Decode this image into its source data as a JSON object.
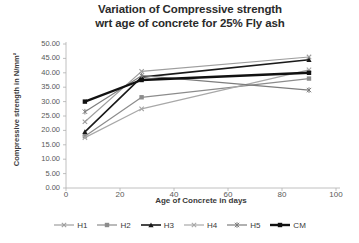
{
  "chart_data": {
    "type": "line",
    "title": "Variation of Compressive strength wrt age of concrete for 25% Fly ash",
    "title_line1": "Variation of Compressive strength",
    "title_line2": "wrt age of concrete for 25% Fly ash",
    "xlabel": "Age of Concrete in days",
    "ylabel": "Compressive strength in N/mm²",
    "x": [
      7,
      28,
      90
    ],
    "xlim": [
      0,
      100
    ],
    "ylim": [
      0,
      50
    ],
    "xticks": [
      "0",
      "20",
      "40",
      "60",
      "80",
      "100"
    ],
    "xtick_values": [
      0,
      20,
      40,
      60,
      80,
      100
    ],
    "yticks": [
      "0.00",
      "5.00",
      "10.00",
      "15.00",
      "20.00",
      "25.00",
      "30.00",
      "35.00",
      "40.00",
      "45.00",
      "50.00"
    ],
    "ytick_values": [
      0,
      5,
      10,
      15,
      20,
      25,
      30,
      35,
      40,
      45,
      50
    ],
    "grid": false,
    "legend_position": "bottom",
    "series": [
      {
        "name": "H1",
        "values": [
          23.0,
          40.5,
          45.5
        ],
        "color": "#9e9e9e",
        "marker": "x",
        "width": 1.2
      },
      {
        "name": "H2",
        "values": [
          18.0,
          31.5,
          38.0
        ],
        "color": "#8c8c8c",
        "marker": "square",
        "width": 1.2
      },
      {
        "name": "H3",
        "values": [
          19.5,
          38.5,
          44.5
        ],
        "color": "#1a1a1a",
        "marker": "triangle",
        "width": 1.6
      },
      {
        "name": "H4",
        "values": [
          17.5,
          27.5,
          41.0
        ],
        "color": "#a8a8a8",
        "marker": "x",
        "width": 1.2
      },
      {
        "name": "H5",
        "values": [
          26.5,
          39.0,
          34.0
        ],
        "color": "#7d7d7d",
        "marker": "star",
        "width": 1.2
      },
      {
        "name": "CM",
        "values": [
          30.0,
          37.5,
          40.0
        ],
        "color": "#111111",
        "marker": "square",
        "width": 2.4
      }
    ]
  },
  "axes": {
    "axis_line_color": "#b0b0b0",
    "tick_color": "#b0b0b0"
  }
}
